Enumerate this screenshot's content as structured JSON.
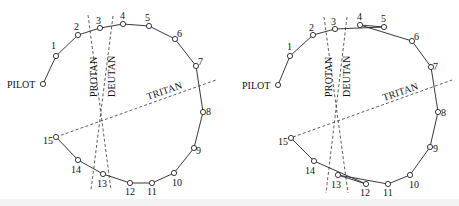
{
  "figure": {
    "panels": [
      {
        "id": "left",
        "caption": "Normal arrangement",
        "pilot_label": "PILOT",
        "axis_labels": {
          "protan": "PROTAN",
          "deutan": "DEUTAN",
          "tritan": "TRITAN"
        },
        "points": [
          {
            "label": "PILOT",
            "x": 43,
            "y": 84
          },
          {
            "label": "1",
            "x": 56,
            "y": 56
          },
          {
            "label": "2",
            "x": 78,
            "y": 35
          },
          {
            "label": "3",
            "x": 100,
            "y": 28
          },
          {
            "label": "4",
            "x": 123,
            "y": 24
          },
          {
            "label": "5",
            "x": 149,
            "y": 26
          },
          {
            "label": "6",
            "x": 175,
            "y": 39
          },
          {
            "label": "7",
            "x": 196,
            "y": 66
          },
          {
            "label": "8",
            "x": 203,
            "y": 112
          },
          {
            "label": "9",
            "x": 194,
            "y": 148
          },
          {
            "label": "10",
            "x": 174,
            "y": 173
          },
          {
            "label": "11",
            "x": 152,
            "y": 183
          },
          {
            "label": "12",
            "x": 130,
            "y": 183
          },
          {
            "label": "13",
            "x": 103,
            "y": 174
          },
          {
            "label": "14",
            "x": 78,
            "y": 160
          },
          {
            "label": "15",
            "x": 56,
            "y": 137
          }
        ],
        "sequence": [
          "PILOT",
          "1",
          "2",
          "3",
          "4",
          "5",
          "6",
          "7",
          "8",
          "9",
          "10",
          "11",
          "12",
          "13",
          "14",
          "15"
        ]
      },
      {
        "id": "right",
        "caption": "Arrangement with minor transpositions",
        "pilot_label": "PILOT",
        "axis_labels": {
          "protan": "PROTAN",
          "deutan": "DEUTAN",
          "tritan": "TRITAN"
        },
        "points": [
          {
            "label": "PILOT",
            "x": 278,
            "y": 85
          },
          {
            "label": "1",
            "x": 290,
            "y": 56
          },
          {
            "label": "2",
            "x": 313,
            "y": 35
          },
          {
            "label": "3",
            "x": 335,
            "y": 29
          },
          {
            "label": "4",
            "x": 360,
            "y": 25
          },
          {
            "label": "5",
            "x": 384,
            "y": 27
          },
          {
            "label": "6",
            "x": 412,
            "y": 41
          },
          {
            "label": "7",
            "x": 431,
            "y": 67
          },
          {
            "label": "8",
            "x": 438,
            "y": 112
          },
          {
            "label": "9",
            "x": 430,
            "y": 147
          },
          {
            "label": "10",
            "x": 410,
            "y": 175
          },
          {
            "label": "11",
            "x": 388,
            "y": 184
          },
          {
            "label": "12",
            "x": 366,
            "y": 184
          },
          {
            "label": "13",
            "x": 338,
            "y": 175
          },
          {
            "label": "14",
            "x": 314,
            "y": 161
          },
          {
            "label": "15",
            "x": 291,
            "y": 138
          }
        ],
        "sequence": [
          "PILOT",
          "1",
          "2",
          "3",
          "5",
          "4",
          "6",
          "7",
          "8",
          "9",
          "10",
          "11",
          "13",
          "12",
          "14",
          "15"
        ]
      }
    ]
  }
}
